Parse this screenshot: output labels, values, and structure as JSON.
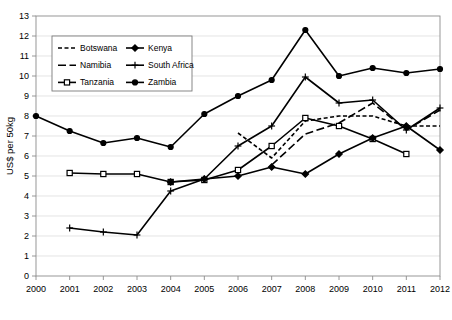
{
  "chart_data": {
    "type": "line",
    "title": "",
    "xlabel": "",
    "ylabel": "US$ per 50kg",
    "x": [
      2000,
      2001,
      2002,
      2003,
      2004,
      2005,
      2006,
      2007,
      2008,
      2009,
      2010,
      2011,
      2012
    ],
    "xtick_labels": [
      "2000",
      "2001",
      "2002",
      "2003",
      "2004",
      "2005",
      "2006",
      "2007",
      "2008",
      "2009",
      "2010",
      "2011",
      "2012"
    ],
    "ytick_labels": [
      "0",
      "1",
      "2",
      "3",
      "4",
      "5",
      "6",
      "7",
      "8",
      "9",
      "10",
      "11",
      "12",
      "13"
    ],
    "ylim": [
      0,
      13
    ],
    "ytick_step": 1,
    "xlim": [
      2000,
      2012
    ],
    "grid": true,
    "grid_axis": "y",
    "legend_position": "top-left-inside",
    "series": [
      {
        "name": "Botswana",
        "style": "short-dash",
        "marker": "none",
        "color": "#000000",
        "x": [
          2006,
          2007,
          2008,
          2009,
          2010,
          2011,
          2012
        ],
        "values": [
          7.15,
          5.9,
          7.75,
          8.0,
          8.0,
          7.5,
          7.5
        ]
      },
      {
        "name": "Namibia",
        "style": "long-dash",
        "marker": "none",
        "color": "#000000",
        "x": [
          2007,
          2008,
          2009,
          2010,
          2011,
          2012
        ],
        "values": [
          5.55,
          7.1,
          7.65,
          8.65,
          7.3,
          8.3
        ]
      },
      {
        "name": "Tanzania",
        "style": "solid",
        "marker": "open-square",
        "color": "#000000",
        "x": [
          2001,
          2002,
          2003,
          2004,
          2005,
          2006,
          2007,
          2008,
          2009,
          2010,
          2011
        ],
        "values": [
          5.15,
          5.1,
          5.1,
          4.7,
          4.8,
          5.3,
          6.5,
          7.9,
          7.5,
          6.85,
          6.1
        ]
      },
      {
        "name": "Kenya",
        "style": "solid",
        "marker": "diamond",
        "color": "#000000",
        "x": [
          2004,
          2005,
          2006,
          2007,
          2008,
          2009,
          2010,
          2011,
          2012
        ],
        "values": [
          4.7,
          4.85,
          5.0,
          5.45,
          5.1,
          6.1,
          6.9,
          7.5,
          6.3
        ]
      },
      {
        "name": "South Africa",
        "style": "solid",
        "marker": "plus",
        "color": "#000000",
        "x": [
          2001,
          2002,
          2003,
          2004,
          2005,
          2006,
          2007,
          2008,
          2009,
          2010,
          2011,
          2012
        ],
        "values": [
          2.4,
          2.2,
          2.05,
          4.25,
          4.85,
          6.5,
          7.5,
          9.95,
          8.65,
          8.8,
          7.3,
          8.4
        ]
      },
      {
        "name": "Zambia",
        "style": "solid",
        "marker": "filled-circle",
        "color": "#000000",
        "x": [
          2000,
          2001,
          2002,
          2003,
          2004,
          2005,
          2006,
          2007,
          2008,
          2009,
          2010,
          2011,
          2012
        ],
        "values": [
          8.0,
          7.25,
          6.65,
          6.9,
          6.45,
          8.1,
          9.0,
          9.8,
          12.3,
          10.0,
          10.4,
          10.15,
          10.35
        ]
      }
    ]
  },
  "legend": {
    "entries": [
      {
        "label": "Botswana"
      },
      {
        "label": "Kenya"
      },
      {
        "label": "Namibia"
      },
      {
        "label": "South Africa"
      },
      {
        "label": "Tanzania"
      },
      {
        "label": "Zambia"
      }
    ]
  }
}
